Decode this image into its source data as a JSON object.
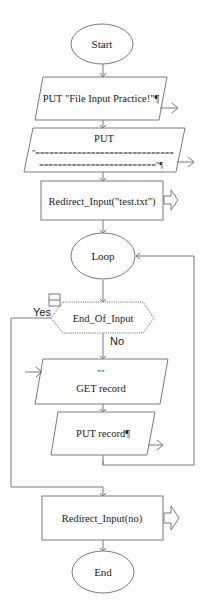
{
  "flowchart": {
    "nodes": {
      "start": {
        "type": "oval",
        "label": "Start"
      },
      "put_title": {
        "type": "output",
        "label": "PUT \"File Input Practice!\"¶"
      },
      "put_line": {
        "type": "output",
        "label_line1": "PUT",
        "label_line2": "\"==============================",
        "label_line3": "=========================\"¶"
      },
      "redirect_file": {
        "type": "call",
        "label": "Redirect_Input(\"test.txt\")"
      },
      "loop": {
        "type": "loop",
        "label": "Loop"
      },
      "end_of_input": {
        "type": "decision",
        "label": "End_Of_Input",
        "yes_label": "Yes",
        "no_label": "No"
      },
      "get_record": {
        "type": "input",
        "label_line1": "\"\"",
        "label_line2": "GET record"
      },
      "put_record": {
        "type": "output",
        "label": "PUT record¶"
      },
      "redirect_no": {
        "type": "call",
        "label": "Redirect_Input(no)"
      },
      "end": {
        "type": "oval",
        "label": "End"
      }
    },
    "colors": {
      "stroke": "#7a7a7a",
      "fill": "#ffffff",
      "text": "#1a1a1a"
    }
  }
}
